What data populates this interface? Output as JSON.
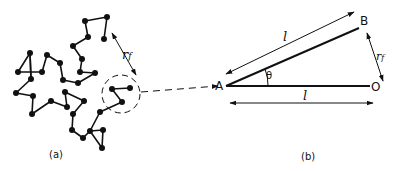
{
  "panels": {
    "a": {
      "label": "(a)",
      "rf_label": "r",
      "rf_sub": "f",
      "chain_points": [
        [
          31,
          79
        ],
        [
          30,
          53
        ],
        [
          18,
          72
        ],
        [
          42,
          72
        ],
        [
          47,
          55
        ],
        [
          60,
          63
        ],
        [
          63,
          80
        ],
        [
          78,
          83
        ],
        [
          95,
          73
        ],
        [
          80,
          72
        ],
        [
          82,
          59
        ],
        [
          73,
          46
        ],
        [
          88,
          37
        ],
        [
          85,
          21
        ],
        [
          107,
          17
        ],
        [
          104,
          39
        ]
      ],
      "chain_points_lower": [
        [
          31,
          79
        ],
        [
          16,
          93
        ],
        [
          33,
          96
        ],
        [
          32,
          114
        ],
        [
          51,
          101
        ],
        [
          67,
          107
        ],
        [
          65,
          92
        ],
        [
          84,
          101
        ],
        [
          73,
          114
        ],
        [
          72,
          130
        ],
        [
          83,
          138
        ],
        [
          90,
          131
        ],
        [
          102,
          148
        ],
        [
          103,
          130
        ],
        [
          90,
          131
        ],
        [
          100,
          112
        ],
        [
          122,
          102
        ],
        [
          112,
          89
        ],
        [
          130,
          88
        ]
      ],
      "circle": {
        "cx": 121,
        "cy": 94,
        "r": 19
      }
    },
    "b": {
      "label": "(b)",
      "point_A": "A",
      "point_B": "B",
      "point_O": "O",
      "angle_label": "θ",
      "length_upper": "l",
      "length_lower": "l",
      "rf_label": "r",
      "rf_sub": "f"
    }
  },
  "colors": {
    "ink": "#111111",
    "background": "#ffffff"
  }
}
